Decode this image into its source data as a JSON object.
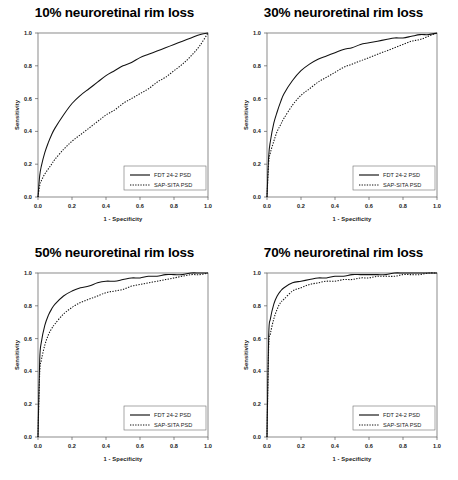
{
  "figure": {
    "name": "roc-curve-panel-figure",
    "background": "#ffffff",
    "panel_count": 4
  },
  "axes": {
    "xlabel": "1 - Specificity",
    "ylabel": "Sensitivity",
    "xticks": [
      "0.0",
      "0.2",
      "0.4",
      "0.6",
      "0.8",
      "1.0"
    ],
    "yticks": [
      "0.0",
      "0.2",
      "0.4",
      "0.6",
      "0.8",
      "1.0"
    ],
    "xlim": [
      0,
      1
    ],
    "ylim": [
      0,
      1
    ],
    "grid": false
  },
  "legend": {
    "position": "lower-right",
    "entries": [
      {
        "label": "FDT 24-2 PSD",
        "style": "solid"
      },
      {
        "label": "SAP-SITA PSD",
        "style": "dotted"
      }
    ]
  },
  "chart_data": [
    {
      "type": "line",
      "title": "10% neuroretinal rim loss",
      "xlabel": "1 - Specificity",
      "ylabel": "Sensitivity",
      "xlim": [
        0,
        1
      ],
      "ylim": [
        0,
        1
      ],
      "grid": false,
      "legend_position": "lower-right",
      "x": [
        0.0,
        0.01,
        0.02,
        0.04,
        0.06,
        0.08,
        0.1,
        0.15,
        0.2,
        0.25,
        0.3,
        0.35,
        0.4,
        0.45,
        0.5,
        0.55,
        0.6,
        0.65,
        0.7,
        0.75,
        0.8,
        0.85,
        0.9,
        0.95,
        1.0
      ],
      "series": [
        {
          "name": "FDT 24-2 PSD",
          "style": "solid",
          "values": [
            0.0,
            0.13,
            0.19,
            0.27,
            0.33,
            0.38,
            0.42,
            0.5,
            0.57,
            0.62,
            0.66,
            0.7,
            0.74,
            0.77,
            0.8,
            0.82,
            0.85,
            0.87,
            0.89,
            0.91,
            0.93,
            0.95,
            0.97,
            0.99,
            1.0
          ]
        },
        {
          "name": "SAP-SITA PSD",
          "style": "dotted",
          "values": [
            0.0,
            0.07,
            0.1,
            0.14,
            0.17,
            0.2,
            0.23,
            0.29,
            0.34,
            0.38,
            0.42,
            0.46,
            0.5,
            0.53,
            0.57,
            0.6,
            0.63,
            0.66,
            0.7,
            0.73,
            0.77,
            0.81,
            0.86,
            0.92,
            1.0
          ]
        }
      ]
    },
    {
      "type": "line",
      "title": "30% neuroretinal rim loss",
      "xlabel": "1 - Specificity",
      "ylabel": "Sensitivity",
      "xlim": [
        0,
        1
      ],
      "ylim": [
        0,
        1
      ],
      "grid": false,
      "legend_position": "lower-right",
      "x": [
        0.0,
        0.01,
        0.02,
        0.04,
        0.06,
        0.08,
        0.1,
        0.15,
        0.2,
        0.25,
        0.3,
        0.35,
        0.4,
        0.45,
        0.5,
        0.55,
        0.6,
        0.65,
        0.7,
        0.75,
        0.8,
        0.85,
        0.9,
        0.95,
        1.0
      ],
      "series": [
        {
          "name": "FDT 24-2 PSD",
          "style": "solid",
          "values": [
            0.0,
            0.25,
            0.34,
            0.45,
            0.52,
            0.58,
            0.63,
            0.71,
            0.77,
            0.81,
            0.84,
            0.86,
            0.88,
            0.9,
            0.91,
            0.93,
            0.94,
            0.95,
            0.96,
            0.97,
            0.97,
            0.98,
            0.99,
            0.99,
            1.0
          ],
          "auc": 0.88
        },
        {
          "name": "SAP-SITA PSD",
          "style": "dotted",
          "values": [
            0.0,
            0.21,
            0.27,
            0.34,
            0.4,
            0.44,
            0.48,
            0.56,
            0.62,
            0.66,
            0.7,
            0.73,
            0.76,
            0.79,
            0.81,
            0.83,
            0.85,
            0.87,
            0.89,
            0.91,
            0.93,
            0.95,
            0.96,
            0.98,
            1.0
          ],
          "auc": 0.79
        }
      ]
    },
    {
      "type": "line",
      "title": "50% neuroretinal rim loss",
      "xlabel": "1 - Specificity",
      "ylabel": "Sensitivity",
      "xlim": [
        0,
        1
      ],
      "ylim": [
        0,
        1
      ],
      "grid": false,
      "legend_position": "lower-right",
      "x": [
        0.0,
        0.01,
        0.02,
        0.04,
        0.06,
        0.08,
        0.1,
        0.15,
        0.2,
        0.25,
        0.3,
        0.35,
        0.4,
        0.45,
        0.5,
        0.55,
        0.6,
        0.65,
        0.7,
        0.75,
        0.8,
        0.85,
        0.9,
        0.95,
        1.0
      ],
      "series": [
        {
          "name": "FDT 24-2 PSD",
          "style": "solid",
          "values": [
            0.0,
            0.47,
            0.58,
            0.68,
            0.74,
            0.78,
            0.81,
            0.86,
            0.89,
            0.91,
            0.92,
            0.94,
            0.95,
            0.95,
            0.96,
            0.97,
            0.97,
            0.98,
            0.98,
            0.99,
            0.99,
            0.99,
            1.0,
            1.0,
            1.0
          ],
          "auc": 0.93
        },
        {
          "name": "SAP-SITA PSD",
          "style": "dotted",
          "values": [
            0.0,
            0.39,
            0.47,
            0.56,
            0.62,
            0.66,
            0.69,
            0.75,
            0.79,
            0.82,
            0.84,
            0.86,
            0.88,
            0.89,
            0.9,
            0.92,
            0.93,
            0.94,
            0.95,
            0.96,
            0.97,
            0.98,
            0.99,
            0.99,
            1.0
          ],
          "auc": 0.87
        }
      ]
    },
    {
      "type": "line",
      "title": "70% neuroretinal rim loss",
      "xlabel": "1 - Specificity",
      "ylabel": "Sensitivity",
      "xlim": [
        0,
        1
      ],
      "ylim": [
        0,
        1
      ],
      "grid": false,
      "legend_position": "lower-right",
      "x": [
        0.0,
        0.01,
        0.02,
        0.04,
        0.06,
        0.08,
        0.1,
        0.15,
        0.2,
        0.25,
        0.3,
        0.35,
        0.4,
        0.45,
        0.5,
        0.55,
        0.6,
        0.65,
        0.7,
        0.75,
        0.8,
        0.85,
        0.9,
        0.95,
        1.0
      ],
      "series": [
        {
          "name": "FDT 24-2 PSD",
          "style": "solid",
          "values": [
            0.0,
            0.62,
            0.72,
            0.81,
            0.86,
            0.89,
            0.91,
            0.94,
            0.95,
            0.96,
            0.97,
            0.97,
            0.98,
            0.98,
            0.99,
            0.99,
            0.99,
            0.99,
            0.99,
            1.0,
            1.0,
            1.0,
            1.0,
            1.0,
            1.0
          ],
          "auc": 0.96
        },
        {
          "name": "SAP-SITA PSD",
          "style": "dotted",
          "values": [
            0.0,
            0.55,
            0.63,
            0.72,
            0.78,
            0.82,
            0.84,
            0.89,
            0.91,
            0.93,
            0.94,
            0.95,
            0.95,
            0.96,
            0.96,
            0.97,
            0.97,
            0.98,
            0.98,
            0.98,
            0.99,
            0.99,
            0.99,
            1.0,
            1.0
          ],
          "auc": 0.93
        }
      ]
    }
  ]
}
